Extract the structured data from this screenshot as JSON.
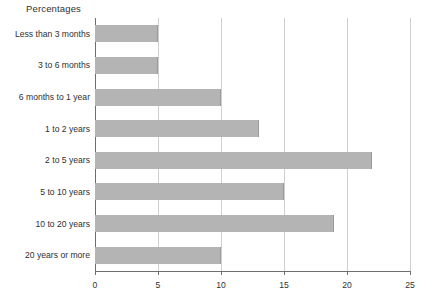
{
  "chart_data": {
    "type": "bar",
    "orientation": "horizontal",
    "title": "Percentages",
    "xlabel": "",
    "ylabel": "",
    "xlim": [
      0,
      25
    ],
    "xticks": [
      "0",
      "5",
      "10",
      "15",
      "20",
      "25"
    ],
    "grid": "vertical",
    "legend": "none",
    "bar_color": "#b4b4b4",
    "axis_color": "#6e6e6e",
    "grid_color": "#cfcfcf",
    "categories": [
      "Less than 3 months",
      "3 to 6 months",
      "6 months to 1 year",
      "1 to 2 years",
      "2 to 5 years",
      "5 to 10 years",
      "10 to 20 years",
      "20 years or more"
    ],
    "values": [
      5,
      5,
      10,
      13,
      22,
      15,
      19,
      10
    ]
  }
}
